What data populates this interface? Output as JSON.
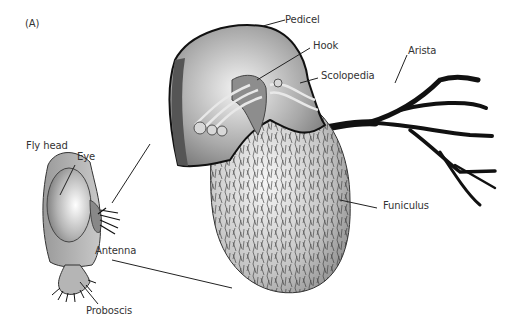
{
  "figure": {
    "panel_label": "(A)",
    "labels": {
      "fly_head": "Fly head",
      "eye": "Eye",
      "antenna": "Antenna",
      "proboscis": "Proboscis",
      "pedicel": "Pedicel",
      "hook": "Hook",
      "scolopedia": "Scolopedia",
      "arista": "Arista",
      "funiculus": "Funiculus"
    }
  }
}
